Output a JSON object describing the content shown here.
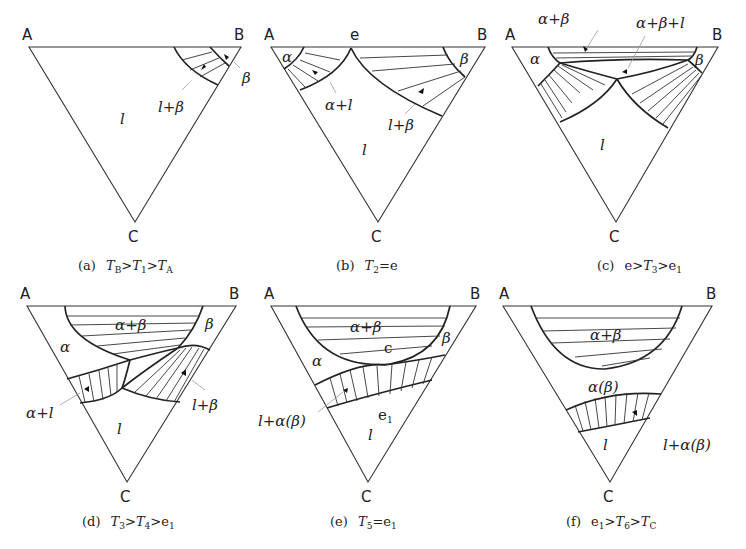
{
  "figure": {
    "panels": [
      {
        "id": "a",
        "vertices": {
          "A": "A",
          "B": "B",
          "C": "C"
        },
        "phases": {
          "liquid": "l",
          "two_phase": "l+β",
          "beta": "β"
        },
        "caption": {
          "tag": "(a)",
          "text": "T_B>T_1>T_A",
          "parts": [
            [
              "T",
              "B"
            ],
            ">",
            [
              "T",
              "1"
            ],
            ">",
            [
              "T",
              "A"
            ]
          ]
        }
      },
      {
        "id": "b",
        "vertices": {
          "A": "A",
          "B": "B",
          "C": "C",
          "e": "e"
        },
        "phases": {
          "alpha": "α",
          "beta": "β",
          "alpha_l": "α+l",
          "l_beta": "l+β",
          "liquid": "l"
        },
        "caption": {
          "tag": "(b)",
          "text": "T_2=e"
        }
      },
      {
        "id": "c",
        "vertices": {
          "A": "A",
          "B": "B",
          "C": "C"
        },
        "phases": {
          "alpha_beta": "α+β",
          "alpha_beta_l": "α+β+l",
          "alpha": "α",
          "beta": "β",
          "liquid": "l"
        },
        "caption": {
          "tag": "(c)",
          "text": "e>T_3>e_1"
        }
      },
      {
        "id": "d",
        "vertices": {
          "A": "A",
          "B": "B",
          "C": "C"
        },
        "phases": {
          "alpha_beta": "α+β",
          "alpha": "α",
          "beta": "β",
          "alpha_l": "α+l",
          "l_beta": "l+β",
          "liquid": "l"
        },
        "caption": {
          "tag": "(d)",
          "text": "T_3>T_4>e_1"
        }
      },
      {
        "id": "e",
        "vertices": {
          "A": "A",
          "B": "B",
          "C": "C"
        },
        "phases": {
          "alpha_beta": "α+β",
          "c_point": "c",
          "alpha": "α",
          "beta": "β",
          "l_alpha_beta": "l+α(β)",
          "e1": "e₁",
          "liquid": "l"
        },
        "caption": {
          "tag": "(e)",
          "text": "T_5=e_1"
        }
      },
      {
        "id": "f",
        "vertices": {
          "A": "A",
          "B": "B",
          "C": "C"
        },
        "phases": {
          "alpha_beta": "α+β",
          "alpha_paren_beta": "α(β)",
          "liquid": "l",
          "l_alpha_beta": "l+α(β)"
        },
        "caption": {
          "tag": "(f)",
          "text": "e_1>T_6>T_C"
        }
      }
    ]
  },
  "labels": {
    "A": "A",
    "B": "B",
    "C": "C",
    "e": "e",
    "l": "l",
    "alpha": "α",
    "beta": "β",
    "l_plus_beta": "l+β",
    "alpha_plus_l": "α+l",
    "alpha_plus_beta": "α+β",
    "alpha_plus_beta_plus_l": "α+β+l",
    "c": "c",
    "e1": "e",
    "e1_sub": "1",
    "l_plus_alpha_beta": "l+α(β)",
    "alpha_beta": "α(β)",
    "cap_a_tag": "(a)",
    "cap_b_tag": "(b)",
    "cap_c_tag": "(c)",
    "cap_d_tag": "(d)",
    "cap_e_tag": "(e)",
    "cap_f_tag": "(f)",
    "T": "T",
    "gt": ">",
    "eq": "=",
    "sub_B": "B",
    "sub_A": "A",
    "sub_C": "C",
    "sub_1": "1",
    "sub_2": "2",
    "sub_3": "3",
    "sub_4": "4",
    "sub_5": "5",
    "sub_6": "6"
  }
}
